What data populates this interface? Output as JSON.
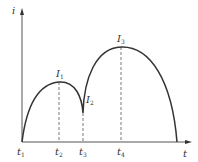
{
  "diagram": {
    "type": "current-time waveform",
    "axes": {
      "y_label": "i",
      "x_label": "t"
    },
    "time_marks": [
      {
        "label": "t",
        "sub": "1"
      },
      {
        "label": "t",
        "sub": "2"
      },
      {
        "label": "t",
        "sub": "3"
      },
      {
        "label": "t",
        "sub": "4"
      }
    ],
    "points": [
      {
        "label": "I",
        "sub": "1"
      },
      {
        "label": "I",
        "sub": "2"
      },
      {
        "label": "I",
        "sub": "3"
      }
    ],
    "colors": {
      "curve": "#333333",
      "axis": "#555555",
      "dashed": "#555555"
    }
  }
}
